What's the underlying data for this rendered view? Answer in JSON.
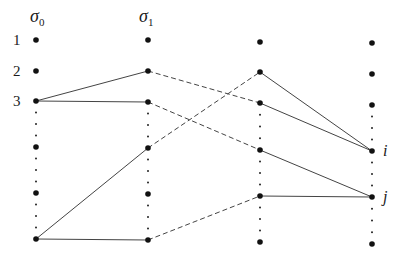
{
  "diagram": {
    "type": "layered-graph",
    "column_labels": [
      {
        "symbol": "σ",
        "subscript": "0",
        "x": 30,
        "y": 22
      },
      {
        "symbol": "σ",
        "subscript": "1",
        "x": 139,
        "y": 22
      }
    ],
    "row_labels": [
      {
        "text": "1",
        "x": 13,
        "y": 45
      },
      {
        "text": "2",
        "x": 13,
        "y": 76
      },
      {
        "text": "3",
        "x": 13,
        "y": 106
      }
    ],
    "node_labels": [
      {
        "text": "i",
        "x": 383,
        "y": 156
      },
      {
        "text": "j",
        "x": 383,
        "y": 202
      }
    ],
    "columns": [
      {
        "x": 36,
        "nodes": [
          40,
          71,
          101,
          147,
          193,
          239
        ]
      },
      {
        "x": 148,
        "nodes": [
          40,
          71,
          102,
          148,
          194,
          240
        ]
      },
      {
        "x": 260,
        "nodes": [
          42,
          72,
          103,
          150,
          196,
          242
        ]
      },
      {
        "x": 372,
        "nodes": [
          43,
          74,
          105,
          151,
          197,
          244
        ]
      }
    ],
    "ellipsis_gaps": [
      [
        2,
        3
      ],
      [
        3,
        4
      ],
      [
        4,
        5
      ]
    ],
    "edges": [
      {
        "from": [
          0,
          2
        ],
        "to": [
          1,
          1
        ],
        "style": "solid"
      },
      {
        "from": [
          0,
          2
        ],
        "to": [
          1,
          2
        ],
        "style": "solid"
      },
      {
        "from": [
          0,
          5
        ],
        "to": [
          1,
          3
        ],
        "style": "solid"
      },
      {
        "from": [
          0,
          5
        ],
        "to": [
          1,
          5
        ],
        "style": "solid"
      },
      {
        "from": [
          1,
          1
        ],
        "to": [
          2,
          2
        ],
        "style": "dashed"
      },
      {
        "from": [
          1,
          2
        ],
        "to": [
          2,
          3
        ],
        "style": "dashed"
      },
      {
        "from": [
          1,
          3
        ],
        "to": [
          2,
          1
        ],
        "style": "dashed"
      },
      {
        "from": [
          1,
          5
        ],
        "to": [
          2,
          4
        ],
        "style": "dashed"
      },
      {
        "from": [
          2,
          1
        ],
        "to": [
          3,
          3
        ],
        "style": "solid"
      },
      {
        "from": [
          2,
          2
        ],
        "to": [
          3,
          3
        ],
        "style": "solid"
      },
      {
        "from": [
          2,
          3
        ],
        "to": [
          3,
          4
        ],
        "style": "solid"
      },
      {
        "from": [
          2,
          4
        ],
        "to": [
          3,
          4
        ],
        "style": "solid"
      }
    ],
    "colors": {
      "node": "#111111",
      "edge": "#444444",
      "ellipsis": "#222222"
    }
  }
}
